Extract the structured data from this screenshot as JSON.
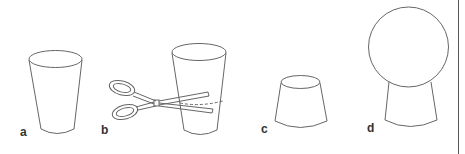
{
  "figure": {
    "panels": [
      {
        "id": "a",
        "label": "a",
        "description": "Plastic cup"
      },
      {
        "id": "b",
        "label": "b",
        "description": "Cutting the cup with scissors along dashed line"
      },
      {
        "id": "c",
        "label": "c",
        "description": "Cut-off cup base"
      },
      {
        "id": "d",
        "label": "d",
        "description": "Balloon resting on cup base"
      }
    ]
  },
  "colors": {
    "line": "#666666",
    "label": "#333333",
    "background": "#ffffff",
    "border": "#555555"
  }
}
